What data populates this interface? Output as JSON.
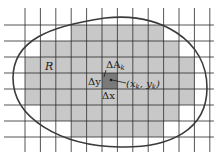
{
  "figure": {
    "colors": {
      "background": "#ffffff",
      "grid_line": "#2a2a2a",
      "inner_cell": "#c8c8c8",
      "highlight_cell": "#7a7a7a",
      "boundary": "#3a3a3a"
    },
    "grid": {
      "columns": 11,
      "rows": 7,
      "shaded_rows": [
        {
          "row": 0,
          "from_col": 3,
          "to_col": 8
        },
        {
          "row": 1,
          "from_col": 1,
          "to_col": 9
        },
        {
          "row": 2,
          "from_col": 0,
          "to_col": 10
        },
        {
          "row": 3,
          "from_col": 0,
          "to_col": 10
        },
        {
          "row": 4,
          "from_col": 0,
          "to_col": 10
        },
        {
          "row": 5,
          "from_col": 1,
          "to_col": 9
        },
        {
          "row": 6,
          "from_col": 3,
          "to_col": 8
        }
      ],
      "highlight_cell": {
        "row": 3,
        "col": 5
      }
    },
    "labels": {
      "region": "R",
      "delta_a": "ΔA",
      "delta_a_sub": "k",
      "delta_y": "Δy",
      "delta_x": "Δx",
      "point_open": "(x",
      "point_sub1": "k",
      "point_mid": ", y",
      "point_sub2": "k",
      "point_close": ")"
    }
  }
}
